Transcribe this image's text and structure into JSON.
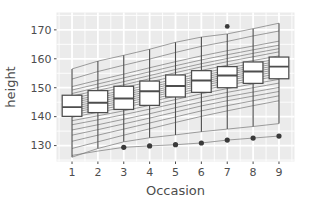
{
  "chart_data": {
    "type": "box",
    "title": "",
    "subtitle": "",
    "xlabel": "Occasion",
    "ylabel": "height",
    "categories": [
      "1",
      "2",
      "3",
      "4",
      "5",
      "6",
      "7",
      "8",
      "9"
    ],
    "xlim": [
      0.4,
      9.6
    ],
    "ylim": [
      124.5,
      176.0
    ],
    "grid": true,
    "grid_major_y": [
      130,
      140,
      150,
      160,
      170
    ],
    "grid_minor_y": [
      125,
      135,
      145,
      155,
      165,
      175
    ],
    "grid_major_x": [
      1,
      2,
      3,
      4,
      5,
      6,
      7,
      8,
      9
    ],
    "legend_position": "none",
    "panel_background": "#ebebeb",
    "grid_color": "#ffffff",
    "box_fill": "#ffffff",
    "box_stroke": "#4d4d4d",
    "line_color": "#7a7a7a",
    "point_color": "#3a3a3a",
    "y_ticks": [
      {
        "value": 130,
        "label": "130"
      },
      {
        "value": 140,
        "label": "140"
      },
      {
        "value": 150,
        "label": "150"
      },
      {
        "value": 160,
        "label": "160"
      },
      {
        "value": 170,
        "label": "170"
      }
    ],
    "x_ticks": [
      {
        "value": 1,
        "label": "1"
      },
      {
        "value": 2,
        "label": "2"
      },
      {
        "value": 3,
        "label": "3"
      },
      {
        "value": 4,
        "label": "4"
      },
      {
        "value": 5,
        "label": "5"
      },
      {
        "value": 6,
        "label": "6"
      },
      {
        "value": 7,
        "label": "7"
      },
      {
        "value": 8,
        "label": "8"
      },
      {
        "value": 9,
        "label": "9"
      }
    ],
    "boxes": [
      {
        "x": 1,
        "min": 126.0,
        "q1": 140.1,
        "median": 143.3,
        "q3": 147.4,
        "max": 156.5,
        "outliers": []
      },
      {
        "x": 2,
        "min": 129.0,
        "q1": 141.4,
        "median": 144.8,
        "q3": 149.0,
        "max": 159.2,
        "outliers": []
      },
      {
        "x": 3,
        "min": 131.3,
        "q1": 142.5,
        "median": 146.3,
        "q3": 150.5,
        "max": 161.2,
        "outliers": []
      },
      {
        "x": 4,
        "min": 132.7,
        "q1": 143.9,
        "median": 148.8,
        "q3": 152.3,
        "max": 163.3,
        "outliers": []
      },
      {
        "x": 5,
        "min": 133.7,
        "q1": 146.8,
        "median": 150.6,
        "q3": 154.4,
        "max": 165.7,
        "outliers": []
      },
      {
        "x": 6,
        "min": 134.8,
        "q1": 148.4,
        "median": 152.5,
        "q3": 155.9,
        "max": 167.5,
        "outliers": []
      },
      {
        "x": 7,
        "min": 135.7,
        "q1": 150.0,
        "median": 154.2,
        "q3": 157.3,
        "max": 168.6,
        "outliers": [
          171.2
        ]
      },
      {
        "x": 8,
        "min": 136.6,
        "q1": 151.5,
        "median": 155.6,
        "q3": 158.9,
        "max": 170.4,
        "outliers": []
      },
      {
        "x": 9,
        "min": 137.6,
        "q1": 153.1,
        "median": 157.3,
        "q3": 160.6,
        "max": 172.3,
        "outliers": []
      }
    ],
    "series": [
      {
        "name": "subject-01",
        "values": [
          156.5,
          159.2,
          161.2,
          163.3,
          165.7,
          167.5,
          168.6,
          170.4,
          172.3
        ]
      },
      {
        "name": "subject-02",
        "values": [
          153.0,
          155.6,
          157.8,
          159.9,
          162.2,
          164.3,
          166.0,
          167.9,
          169.6
        ]
      },
      {
        "name": "subject-03",
        "values": [
          150.4,
          152.6,
          154.7,
          156.9,
          159.0,
          161.0,
          162.8,
          164.4,
          166.1
        ]
      },
      {
        "name": "subject-04",
        "values": [
          149.2,
          151.3,
          153.4,
          155.5,
          157.6,
          159.6,
          161.4,
          163.1,
          164.7
        ]
      },
      {
        "name": "subject-05",
        "values": [
          148.0,
          150.1,
          152.1,
          154.2,
          156.3,
          158.3,
          160.1,
          161.9,
          163.5
        ]
      },
      {
        "name": "subject-06",
        "values": [
          147.1,
          149.1,
          151.0,
          153.1,
          155.2,
          157.2,
          159.0,
          160.7,
          162.4
        ]
      },
      {
        "name": "subject-07",
        "values": [
          146.3,
          148.2,
          150.1,
          152.0,
          154.0,
          156.0,
          157.8,
          159.4,
          161.0
        ]
      },
      {
        "name": "subject-08",
        "values": [
          145.6,
          147.3,
          149.1,
          151.0,
          153.0,
          155.0,
          156.8,
          158.4,
          160.0
        ]
      },
      {
        "name": "subject-09",
        "values": [
          144.9,
          146.6,
          148.3,
          150.2,
          152.2,
          154.2,
          156.0,
          157.6,
          159.2
        ]
      },
      {
        "name": "subject-10",
        "values": [
          144.2,
          145.9,
          147.6,
          149.5,
          151.5,
          153.5,
          155.3,
          156.9,
          158.5
        ]
      },
      {
        "name": "subject-11",
        "values": [
          143.5,
          145.2,
          146.9,
          148.8,
          150.8,
          152.8,
          154.6,
          156.2,
          157.8
        ]
      },
      {
        "name": "subject-12",
        "values": [
          142.8,
          144.5,
          146.2,
          148.1,
          150.1,
          152.1,
          153.9,
          155.5,
          157.1
        ]
      },
      {
        "name": "subject-13",
        "values": [
          142.1,
          143.8,
          145.5,
          147.4,
          149.4,
          151.4,
          153.2,
          154.8,
          156.4
        ]
      },
      {
        "name": "subject-14",
        "values": [
          141.4,
          143.1,
          144.8,
          146.7,
          148.7,
          150.7,
          152.5,
          154.1,
          155.7
        ]
      },
      {
        "name": "subject-15",
        "values": [
          140.6,
          142.3,
          144.0,
          145.9,
          147.9,
          149.9,
          151.7,
          153.3,
          154.9
        ]
      },
      {
        "name": "subject-16",
        "values": [
          139.8,
          141.5,
          143.2,
          145.1,
          147.1,
          149.1,
          150.9,
          152.5,
          154.1
        ]
      },
      {
        "name": "subject-17",
        "values": [
          138.6,
          140.3,
          142.0,
          143.9,
          145.9,
          147.9,
          149.7,
          151.3,
          152.9
        ]
      },
      {
        "name": "subject-18",
        "values": [
          137.2,
          138.9,
          140.7,
          142.6,
          144.6,
          146.6,
          148.4,
          150.0,
          151.6
        ]
      },
      {
        "name": "subject-19",
        "values": [
          135.4,
          137.2,
          139.1,
          141.0,
          143.1,
          145.1,
          146.9,
          148.5,
          150.1
        ]
      },
      {
        "name": "subject-20",
        "values": [
          133.6,
          135.5,
          137.5,
          139.5,
          141.6,
          143.7,
          145.5,
          147.1,
          148.7
        ]
      },
      {
        "name": "subject-21",
        "values": [
          131.5,
          133.6,
          135.7,
          137.8,
          139.9,
          142.0,
          143.8,
          145.5,
          147.2
        ]
      },
      {
        "name": "subject-22",
        "values": [
          129.0,
          131.3,
          133.6,
          135.8,
          138.0,
          140.1,
          142.0,
          143.8,
          145.5
        ]
      },
      {
        "name": "subject-23",
        "values": [
          126.0,
          129.0,
          131.3,
          132.7,
          133.7,
          134.8,
          135.7,
          136.6,
          137.6
        ]
      },
      {
        "name": "subject-24-lowline",
        "values": [
          126.6,
          128.1,
          129.4,
          129.9,
          130.3,
          130.9,
          131.9,
          132.6,
          133.3
        ]
      }
    ],
    "point_series": {
      "name": "lowest-subject-points",
      "x": [
        3,
        4,
        5,
        6,
        7,
        8,
        9
      ],
      "values": [
        129.4,
        129.9,
        130.3,
        130.9,
        131.9,
        132.6,
        133.3
      ]
    }
  }
}
